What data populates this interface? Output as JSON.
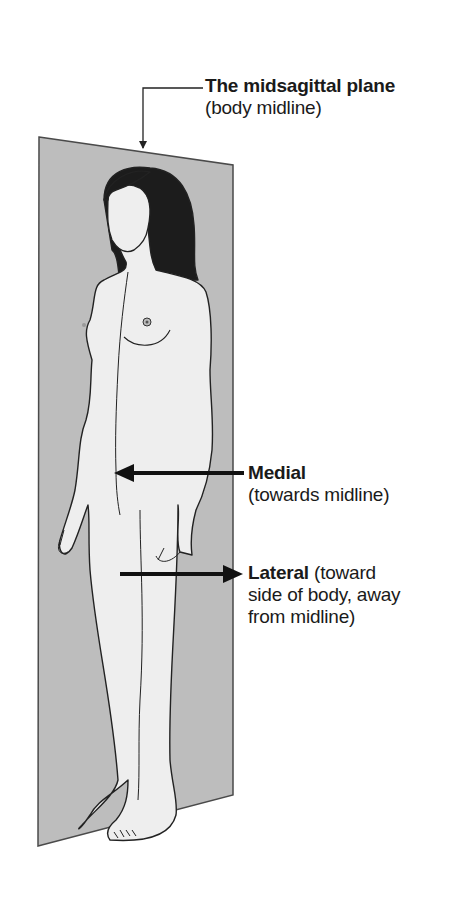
{
  "diagram": {
    "title": "The midsagittal plane",
    "colors": {
      "plane_fill": "#bdbdbd",
      "plane_edge": "#4a4a4a",
      "skin": "#eeeeee",
      "hair": "#1c1c1c",
      "outline": "#222222",
      "arrow": "#111111",
      "text": "#1a1a1a"
    },
    "labels": {
      "plane": {
        "bold": "The midsagittal plane",
        "note": "(body midline)"
      },
      "medial": {
        "bold": "Medial",
        "note": "(towards midline)"
      },
      "lateral": {
        "bold": "Lateral",
        "note_inline": "(toward",
        "note_line2": "side of body, away",
        "note_line3": "from midline)"
      }
    },
    "arrows": [
      {
        "name": "plane-pointer",
        "from": [
          205,
          88
        ],
        "corner": [
          143,
          88
        ],
        "to": [
          143,
          150
        ]
      },
      {
        "name": "medial-arrow",
        "from": [
          244,
          473
        ],
        "to": [
          114,
          473
        ],
        "direction": "left"
      },
      {
        "name": "lateral-arrow",
        "from": [
          120,
          574
        ],
        "to": [
          242,
          574
        ],
        "direction": "right"
      }
    ]
  }
}
